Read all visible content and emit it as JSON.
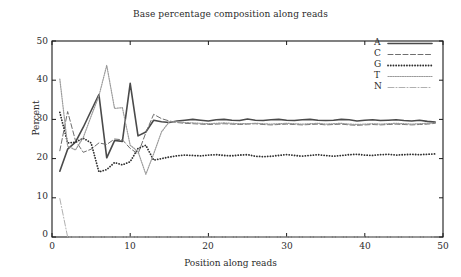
{
  "chart_data": {
    "type": "line",
    "title": "Base percentage composition along reads",
    "xlabel": "Position along reads",
    "ylabel": "Percent",
    "xlim": [
      0,
      50
    ],
    "ylim": [
      0,
      50
    ],
    "xticks": [
      0,
      10,
      20,
      30,
      40,
      50
    ],
    "yticks": [
      0,
      10,
      20,
      30,
      40,
      50
    ],
    "grid": false,
    "legend_position": "top-right",
    "legend_entries": [
      "A",
      "C",
      "G",
      "T",
      "N"
    ],
    "x": [
      1,
      2,
      3,
      4,
      5,
      6,
      7,
      8,
      9,
      10,
      11,
      12,
      13,
      14,
      15,
      16,
      17,
      18,
      19,
      20,
      21,
      22,
      23,
      24,
      25,
      26,
      27,
      28,
      29,
      30,
      31,
      32,
      33,
      34,
      35,
      36,
      37,
      38,
      39,
      40,
      41,
      42,
      43,
      44,
      45,
      46,
      47,
      48,
      49
    ],
    "series": [
      {
        "name": "A",
        "style": "solid",
        "color": "#4a4a4a",
        "width": 1.6,
        "values": [
          16.8,
          22.4,
          24.2,
          28.0,
          32.2,
          36.3,
          20.2,
          24.6,
          24.4,
          39.2,
          25.8,
          26.8,
          29.8,
          29.4,
          29.2,
          29.6,
          29.8,
          30.0,
          29.8,
          29.6,
          29.9,
          30.0,
          29.8,
          29.7,
          30.1,
          29.8,
          29.7,
          29.9,
          30.0,
          29.8,
          29.7,
          29.9,
          30.0,
          29.8,
          29.7,
          29.8,
          30.0,
          29.9,
          29.6,
          29.8,
          29.9,
          29.7,
          29.8,
          29.9,
          29.7,
          29.6,
          29.8,
          29.5,
          29.3
        ]
      },
      {
        "name": "C",
        "style": "dashed",
        "color": "#6e6e6e",
        "width": 1.0,
        "values": [
          22.0,
          32.0,
          24.6,
          21.6,
          22.4,
          24.0,
          23.6,
          25.0,
          24.8,
          22.6,
          21.2,
          26.6,
          31.3,
          30.2,
          29.6,
          29.2,
          29.0,
          28.9,
          28.8,
          28.7,
          28.8,
          28.9,
          28.8,
          28.7,
          28.8,
          28.9,
          28.7,
          28.6,
          28.7,
          28.8,
          28.7,
          28.6,
          28.7,
          28.8,
          28.6,
          28.7,
          28.8,
          28.6,
          28.5,
          28.6,
          28.7,
          28.6,
          28.7,
          28.8,
          28.7,
          28.6,
          28.7,
          28.8,
          29.0
        ]
      },
      {
        "name": "G",
        "style": "dotted-round",
        "color": "#2f2f2f",
        "width": 1.8,
        "values": [
          31.8,
          24.0,
          24.2,
          25.2,
          24.0,
          16.6,
          17.2,
          19.0,
          18.4,
          19.2,
          22.6,
          23.4,
          19.6,
          20.0,
          20.4,
          20.7,
          20.9,
          20.8,
          20.7,
          20.9,
          21.0,
          20.8,
          20.7,
          20.9,
          21.0,
          20.6,
          20.5,
          20.6,
          20.8,
          21.0,
          20.8,
          20.6,
          20.8,
          21.0,
          20.8,
          20.6,
          20.8,
          21.0,
          21.1,
          20.9,
          20.8,
          21.0,
          21.1,
          20.9,
          21.0,
          21.1,
          21.0,
          21.1,
          21.2
        ]
      },
      {
        "name": "T",
        "style": "fine-dotted",
        "color": "#9a9a9a",
        "width": 1.2,
        "values": [
          40.3,
          23.2,
          22.2,
          25.4,
          30.8,
          36.0,
          43.8,
          32.8,
          33.0,
          23.4,
          21.8,
          16.0,
          21.2,
          26.8,
          29.4,
          29.4,
          29.2,
          29.1,
          29.0,
          28.9,
          29.0,
          29.1,
          29.0,
          28.9,
          28.9,
          29.0,
          28.9,
          28.8,
          28.9,
          29.0,
          28.9,
          28.8,
          28.9,
          29.0,
          28.8,
          28.9,
          29.0,
          28.8,
          28.7,
          28.8,
          28.9,
          28.8,
          28.9,
          29.0,
          28.9,
          28.8,
          28.9,
          29.0,
          29.1
        ]
      },
      {
        "name": "N",
        "style": "dash-dot",
        "color": "#b0b0b0",
        "width": 1.0,
        "values": [
          9.8,
          0.0,
          0.0,
          0.0,
          0.0,
          0.0,
          0.0,
          0.0,
          0.0,
          0.0,
          0.0,
          0.0,
          0.0,
          0.0,
          0.0,
          0.0,
          0.0,
          0.0,
          0.0,
          0.0,
          0.0,
          0.0,
          0.0,
          0.0,
          0.0,
          0.0,
          0.0,
          0.0,
          0.0,
          0.0,
          0.0,
          0.0,
          0.0,
          0.0,
          0.0,
          0.0,
          0.0,
          0.0,
          0.0,
          0.0,
          0.0,
          0.0,
          0.0,
          0.0,
          0.0,
          0.0,
          0.0,
          0.0,
          0.0
        ]
      }
    ]
  },
  "axes": {
    "ytick_labels": [
      "0",
      "10",
      "20",
      "30",
      "40",
      "50"
    ],
    "xtick_labels": [
      "0",
      "10",
      "20",
      "30",
      "40",
      "50"
    ],
    "frame_color": "#1a1a1a"
  }
}
